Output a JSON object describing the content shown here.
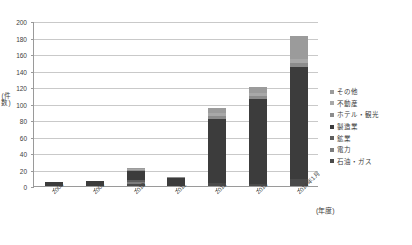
{
  "chart_data": {
    "type": "bar",
    "stacked": true,
    "title": "",
    "xlabel": "(年度)",
    "ylabel": "(件数)",
    "ylim": [
      0,
      200
    ],
    "ystep": 20,
    "ytick_labels": [
      "200",
      "180",
      "160",
      "140",
      "120",
      "100",
      "80",
      "60",
      "40",
      "20",
      "0"
    ],
    "grid": true,
    "legend_position": "right",
    "categories": [
      "2008",
      "2009",
      "2010",
      "2011",
      "2012",
      "2013",
      "2014年1月"
    ],
    "series": [
      {
        "name": "石油・ガス",
        "color": "#4a4a4a",
        "values": [
          0,
          0,
          3,
          0,
          4,
          2,
          8
        ]
      },
      {
        "name": "電力",
        "color": "#7d7d7d",
        "values": [
          0,
          0,
          2,
          0,
          0,
          0,
          0
        ]
      },
      {
        "name": "鉱業",
        "color": "#5e5e5e",
        "values": [
          0,
          0,
          2,
          0,
          0,
          0,
          0
        ]
      },
      {
        "name": "製造業",
        "color": "#3c3c3c",
        "values": [
          5,
          6,
          11,
          10,
          77,
          104,
          136
        ]
      },
      {
        "name": "ホテル・観光",
        "color": "#8c8c8c",
        "values": [
          0,
          0,
          2,
          1,
          4,
          3,
          5
        ]
      },
      {
        "name": "不動産",
        "color": "#a8a8a8",
        "values": [
          0,
          0,
          1,
          0,
          3,
          4,
          5
        ]
      },
      {
        "name": "その他",
        "color": "#9b9b9b",
        "values": [
          0,
          0,
          1,
          0,
          6,
          7,
          28
        ]
      }
    ],
    "totals": [
      5,
      6,
      22,
      11,
      94,
      120,
      182
    ]
  },
  "legend": {
    "entries": [
      {
        "label": "その他",
        "color": "#9b9b9b"
      },
      {
        "label": "不動産",
        "color": "#a8a8a8"
      },
      {
        "label": "ホテル・観光",
        "color": "#8c8c8c"
      },
      {
        "label": "製造業",
        "color": "#3c3c3c"
      },
      {
        "label": "鉱業",
        "color": "#5e5e5e"
      },
      {
        "label": "電力",
        "color": "#7d7d7d"
      },
      {
        "label": "石油・ガス",
        "color": "#4a4a4a"
      }
    ]
  },
  "axes": {
    "y_title": "(件数)",
    "x_title": "(年度)"
  }
}
